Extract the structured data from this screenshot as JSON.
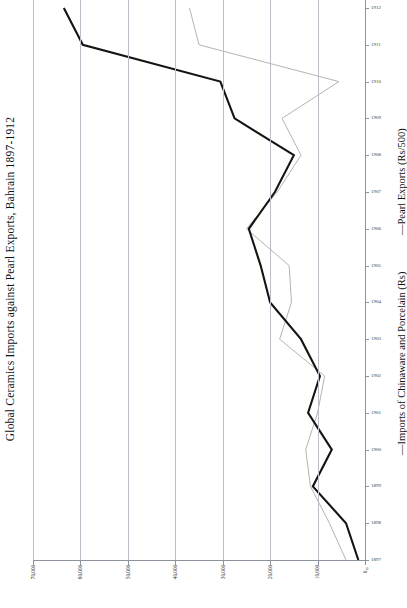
{
  "chart_data": {
    "type": "line",
    "title": "Global Ceramics Imports against Pearl Exports, Bahrain 1897-1912",
    "orientation": "rotated-90",
    "xlabel": "",
    "ylabel": "",
    "grid": true,
    "legend_position": "right",
    "value_axis": {
      "name": "value-axis-bottom",
      "ticks": [
        70000,
        60000,
        50000,
        40000,
        30000,
        20000,
        10000,
        0
      ],
      "tick_labels": [
        "70,000",
        "60,000",
        "50,000",
        "40,000",
        "30,000",
        "20,000",
        "10,000",
        "0"
      ],
      "min": 0,
      "max": 70000,
      "direction": "right-to-left"
    },
    "category_axis": {
      "name": "year-axis-right",
      "label": "",
      "categories": [
        1897,
        1898,
        1899,
        1900,
        1901,
        1902,
        1903,
        1904,
        1905,
        1906,
        1907,
        1908,
        1909,
        1910,
        1911,
        1912
      ],
      "tick_labels": [
        "1897",
        "1898",
        "1899",
        "1900",
        "1901",
        "1902",
        "1903",
        "1904",
        "1905",
        "1906",
        "1907",
        "1908",
        "1909",
        "1910",
        "1911",
        "1912"
      ],
      "zero_marker": "0",
      "direction": "bottom-to-top"
    },
    "categories": [
      1897,
      1898,
      1899,
      1900,
      1901,
      1902,
      1903,
      1904,
      1905,
      1906,
      1907,
      1908,
      1909,
      1910,
      1911,
      1912
    ],
    "series": [
      {
        "name": "Pearl Exports (Rs/500)",
        "legend_label": "—Pearl Exports (Rs/500)",
        "color": "#141414",
        "width": 2.1,
        "values": [
          1400,
          4000,
          11000,
          7000,
          12000,
          9500,
          13500,
          20000,
          22000,
          24500,
          19000,
          15000,
          27500,
          30500,
          59500,
          63500
        ]
      },
      {
        "name": "Imports of Chinaware and Porcelain (Rs)",
        "legend_label": "—Imports of Chinaware and Porcelain (Rs)",
        "color": "#b4b4b4",
        "width": 1.0,
        "values": [
          4000,
          7500,
          11500,
          12500,
          10000,
          8500,
          18000,
          15500,
          16000,
          25000,
          18500,
          13500,
          17500,
          5500,
          35000,
          37000
        ]
      }
    ]
  },
  "legend": {
    "entries": [
      {
        "label": "—Pearl Exports (Rs/500)",
        "color": "#141414"
      },
      {
        "label": "—Imports of Chinaware and Porcelain (Rs)",
        "color": "#b4b4b4"
      }
    ]
  }
}
